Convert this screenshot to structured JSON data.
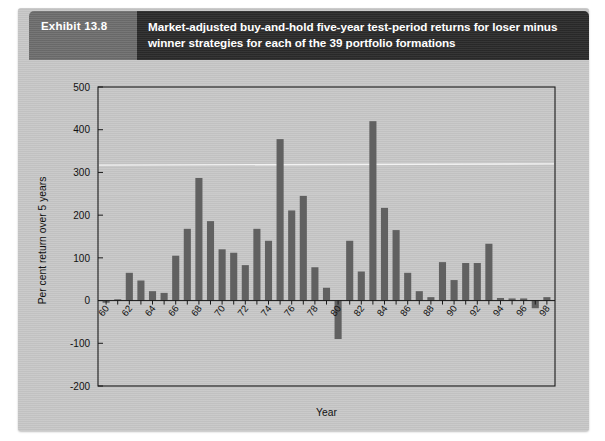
{
  "header": {
    "exhibit_label": "Exhibit 13.8",
    "title": "Market-adjusted buy-and-hold five-year test-period returns for loser minus winner strategies for each of the 39 portfolio formations"
  },
  "chart_data": {
    "type": "bar",
    "title": "",
    "xlabel": "Year",
    "ylabel": "Per cent return over 5 years",
    "ylim": [
      -200,
      500
    ],
    "yticks": [
      -200,
      -100,
      0,
      100,
      200,
      300,
      400,
      500
    ],
    "ytick_labels": [
      "-200",
      "-100",
      "0",
      "100",
      "200",
      "300",
      "400",
      "500"
    ],
    "xlim": [
      59.3,
      98.7
    ],
    "xticks": [
      60,
      62,
      64,
      66,
      68,
      70,
      72,
      74,
      76,
      78,
      80,
      82,
      84,
      86,
      88,
      90,
      92,
      94,
      96,
      98
    ],
    "xtick_labels": [
      "60",
      "62",
      "64",
      "66",
      "68",
      "70",
      "72",
      "74",
      "76",
      "78",
      "80",
      "82",
      "84",
      "86",
      "88",
      "90",
      "92",
      "94",
      "96",
      "98"
    ],
    "grid": false,
    "legend": "none",
    "bar_color": "#616161",
    "categories": [
      60,
      61,
      62,
      63,
      64,
      65,
      66,
      67,
      68,
      69,
      70,
      71,
      72,
      73,
      74,
      75,
      76,
      77,
      78,
      79,
      80,
      81,
      82,
      83,
      84,
      85,
      86,
      87,
      88,
      89,
      90,
      91,
      92,
      93,
      94,
      95,
      96,
      97,
      98
    ],
    "values": [
      -5,
      3,
      65,
      47,
      22,
      18,
      105,
      168,
      287,
      186,
      120,
      112,
      83,
      168,
      140,
      378,
      211,
      245,
      78,
      30,
      -90,
      140,
      68,
      420,
      217,
      165,
      65,
      22,
      8,
      90,
      48,
      88,
      88,
      133,
      6,
      5,
      5,
      -18,
      8
    ]
  }
}
